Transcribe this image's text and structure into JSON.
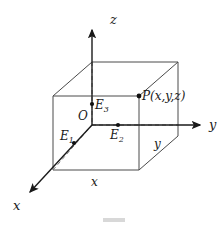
{
  "figure": {
    "kind": "3d-coordinate-box-diagram",
    "background_color": "#ffffff",
    "stroke_color": "#444444",
    "axis_color": "#1a1a1a",
    "label_color": "#1a1a1a",
    "axes": [
      {
        "name": "z-axis",
        "label": "z",
        "direction": "up"
      },
      {
        "name": "y-axis",
        "label": "y",
        "direction": "right"
      },
      {
        "name": "x-axis",
        "label": "x",
        "direction": "down-left"
      }
    ],
    "axis_labels": {
      "x": "x",
      "y": "y",
      "z": "z"
    },
    "edge_labels": {
      "bottom_front": "x",
      "right_front": "y"
    },
    "points": [
      {
        "name": "origin",
        "label": "O",
        "subscript": ""
      },
      {
        "name": "point-E1",
        "label": "E",
        "subscript": "1"
      },
      {
        "name": "point-E2",
        "label": "E",
        "subscript": "2"
      },
      {
        "name": "point-E3",
        "label": "E",
        "subscript": "3"
      },
      {
        "name": "point-P",
        "label": "P(x,y,z)",
        "subscript": ""
      }
    ],
    "point_labels": {
      "origin": "O",
      "E1_base": "E",
      "E1_sub": "1",
      "E2_base": "E",
      "E2_sub": "2",
      "E3_base": "E",
      "E3_sub": "3",
      "P": "P(x,y,z)"
    }
  }
}
